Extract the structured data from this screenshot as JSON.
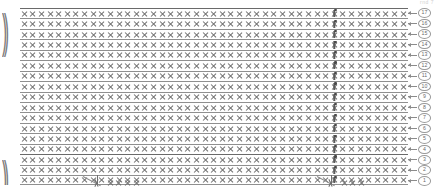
{
  "diagram": {
    "kind": "crochet-stitch-chart",
    "top_label": "rnd 7",
    "grid": {
      "columns": 45,
      "rows": 17,
      "default_symbol": "x",
      "default_symbol_name": "single-crochet-x",
      "special_symbol": "extended-stitch-bar",
      "special_symbol_column": 36,
      "row_separator_color": "#8f8f8f",
      "glyph_color": "#6e6e6e"
    },
    "row_numbers": [
      {
        "row": 17,
        "label": "17",
        "direction": "left"
      },
      {
        "row": 16,
        "label": "16",
        "direction": "left"
      },
      {
        "row": 15,
        "label": "15",
        "direction": "left"
      },
      {
        "row": 14,
        "label": "14",
        "direction": "left"
      },
      {
        "row": 13,
        "label": "13",
        "direction": "left"
      },
      {
        "row": 12,
        "label": "12",
        "direction": "left"
      },
      {
        "row": 11,
        "label": "11",
        "direction": "left"
      },
      {
        "row": 10,
        "label": "10",
        "direction": "left"
      },
      {
        "row": 9,
        "label": "9",
        "direction": "left"
      },
      {
        "row": 8,
        "label": "8",
        "direction": "left"
      },
      {
        "row": 7,
        "label": "7",
        "direction": "left"
      },
      {
        "row": 6,
        "label": "6",
        "direction": "left"
      },
      {
        "row": 5,
        "label": "5",
        "direction": "left"
      },
      {
        "row": 4,
        "label": "4",
        "direction": "left"
      },
      {
        "row": 3,
        "label": "3",
        "direction": "left"
      },
      {
        "row": 2,
        "label": "2",
        "direction": "left"
      },
      {
        "row": 1,
        "label": "1",
        "direction": "left"
      }
    ],
    "repeat_brackets": [
      {
        "name": "top-repeat-bracket",
        "glyph": "))",
        "start_row": 1,
        "span_rows": 5
      },
      {
        "name": "bottom-repeat-bracket",
        "glyph": "))",
        "start_row": 15,
        "span_rows": 3
      }
    ],
    "bottom_increases": [
      {
        "name": "increase-left",
        "glyph": "V",
        "x": 84
      },
      {
        "name": "increase-right",
        "glyph": "V",
        "x": 318
      }
    ],
    "bottom_tail_cells_left": 4,
    "bottom_tail_cells_right": 3
  }
}
